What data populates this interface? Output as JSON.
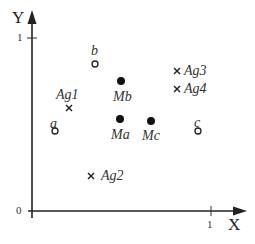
{
  "diagram": {
    "axes": {
      "x_label": "X",
      "y_label": "Y",
      "x_ticks": [
        "0",
        "1"
      ],
      "y_ticks": [
        "0",
        "1"
      ],
      "origin_label": "0",
      "x_one_label": "1",
      "y_one_label": "1"
    },
    "objects": [
      {
        "id": "a",
        "label": "a",
        "marker": "open-circle",
        "x": 0.13,
        "y": 0.46
      },
      {
        "id": "b",
        "label": "b",
        "marker": "open-circle",
        "x": 0.35,
        "y": 0.85
      },
      {
        "id": "c",
        "label": "c",
        "marker": "open-circle",
        "x": 0.93,
        "y": 0.46
      }
    ],
    "means": [
      {
        "id": "Ma",
        "label": "Ma",
        "marker": "filled-circle",
        "x": 0.49,
        "y": 0.53
      },
      {
        "id": "Mb",
        "label": "Mb",
        "marker": "filled-circle",
        "x": 0.49,
        "y": 0.75
      },
      {
        "id": "Mc",
        "label": "Mc",
        "marker": "filled-circle",
        "x": 0.66,
        "y": 0.52
      }
    ],
    "agents": [
      {
        "id": "Ag1",
        "label": "Ag1",
        "marker": "cross",
        "x": 0.21,
        "y": 0.59
      },
      {
        "id": "Ag2",
        "label": "Ag2",
        "marker": "cross",
        "x": 0.33,
        "y": 0.2
      },
      {
        "id": "Ag3",
        "label": "Ag3",
        "marker": "cross",
        "x": 0.81,
        "y": 0.8
      },
      {
        "id": "Ag4",
        "label": "Ag4",
        "marker": "cross",
        "x": 0.81,
        "y": 0.71
      }
    ]
  }
}
